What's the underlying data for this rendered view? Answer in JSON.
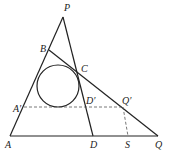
{
  "diagram": {
    "type": "geometry",
    "labels": {
      "P": "P",
      "B": "B",
      "C": "C",
      "A_prime": "A′",
      "D_prime": "D′",
      "Q_prime": "Q′",
      "A": "A",
      "D": "D",
      "S": "S",
      "Q": "Q"
    },
    "points": {
      "P": [
        63,
        17
      ],
      "B": [
        49,
        50
      ],
      "C": [
        78,
        70
      ],
      "A_prime": [
        24,
        107
      ],
      "D_prime": [
        86,
        107
      ],
      "Q_prime": [
        123,
        107
      ],
      "A": [
        10,
        136
      ],
      "D": [
        93,
        136
      ],
      "S": [
        128,
        136
      ],
      "Q": [
        158,
        136
      ]
    },
    "circle": {
      "cx": 58,
      "cy": 86,
      "r": 21
    },
    "colors": {
      "stroke": "#222222",
      "dashed": "#555555"
    }
  }
}
